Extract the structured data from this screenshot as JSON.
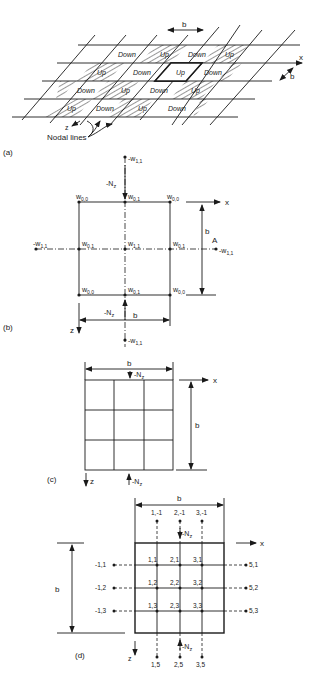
{
  "figure_a": {
    "panel_label": "(a)",
    "dimension_b_top": "b",
    "dimension_b_right": "b",
    "axis_x": "x",
    "axis_z": "z",
    "nodal_lines_label": "Nodal lines",
    "row1": [
      "Down",
      "Up",
      "Down",
      "Up"
    ],
    "row2": [
      "Up",
      "Down",
      "Up",
      "Down"
    ],
    "row3": [
      "Down",
      "Up",
      "Down",
      "Up"
    ],
    "row4": [
      "Up",
      "Down",
      "Up",
      "Down"
    ]
  },
  "figure_b": {
    "panel_label": "(b)",
    "axis_x": "x",
    "axis_z": "z",
    "load_top": "-N",
    "load_top_sub": "z",
    "load_bottom": "-N",
    "load_bottom_sub": "z",
    "dimension_b_bottom": "b",
    "dimension_b_right": "b",
    "point_A": "A",
    "nodes": {
      "top_outer": "-w",
      "top_outer_sub": "1,1",
      "corner_tl": "w",
      "corner_tl_sub": "0,0",
      "top_mid": "w",
      "top_mid_sub": "0,1",
      "corner_tr": "w",
      "corner_tr_sub": "0,0",
      "left_outer": "-w",
      "left_outer_sub": "1,1",
      "left_mid": "w",
      "left_mid_sub": "0,1",
      "center": "w",
      "center_sub": "1,1",
      "right_mid": "w",
      "right_mid_sub": "0,1",
      "right_outer": "-w",
      "right_outer_sub": "1,1",
      "corner_bl": "w",
      "corner_bl_sub": "0,0",
      "bottom_mid": "w",
      "bottom_mid_sub": "0,1",
      "corner_br": "w",
      "corner_br_sub": "0,0",
      "bottom_outer": "-w",
      "bottom_outer_sub": "1,1"
    }
  },
  "figure_c": {
    "panel_label": "(c)",
    "axis_x": "x",
    "axis_z": "z",
    "dimension_b_top": "b",
    "dimension_b_right": "b",
    "load_top": "-N",
    "load_top_sub": "z",
    "load_bottom": "-N",
    "load_bottom_sub": "z"
  },
  "figure_d": {
    "panel_label": "(d)",
    "axis_x": "x",
    "axis_z": "z",
    "dimension_b_top": "b",
    "dimension_b_left": "b",
    "load_top": "-N",
    "load_top_sub": "z",
    "load_bottom": "-N",
    "load_bottom_sub": "z",
    "top_outer_nodes": [
      "1,-1",
      "2,-1",
      "3,-1"
    ],
    "bottom_outer_nodes": [
      "1,5",
      "2,5",
      "3,5"
    ],
    "left_outer_nodes": [
      "-1,1",
      "-1,2",
      "-1,3"
    ],
    "right_outer_nodes": [
      "5,1",
      "5,2",
      "5,3"
    ],
    "interior_rows": [
      [
        "1,1",
        "2,1",
        "3,1"
      ],
      [
        "1,2",
        "2,2",
        "3,2"
      ],
      [
        "1,3",
        "2,3",
        "3,3"
      ]
    ]
  }
}
